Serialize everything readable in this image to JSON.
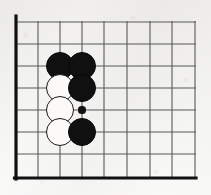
{
  "figure": {
    "name": "go-board-corner-diagram",
    "kind": "go-board",
    "corner": "upper-left",
    "background_color": "#f3f2f0",
    "line_color": "#595959",
    "border_color": "#111111",
    "black_stone_color": "#111010",
    "white_stone_color": "#fbfaf8",
    "white_stone_outline_color": "#1a1918"
  },
  "board": {
    "columns": 9,
    "rows": 8,
    "cell_size": 22,
    "origin_x": 16,
    "origin_y": 22,
    "border_width": 3.2,
    "line_width": 1.1,
    "column_positions": [
      16,
      38,
      60,
      82,
      104,
      127,
      150,
      172,
      195
    ],
    "row_positions": [
      22,
      44,
      66,
      88,
      110,
      132,
      154,
      178
    ],
    "left_edge_x": 16,
    "top_edge_y": 22,
    "right_edge_x": 195,
    "bottom_edge_y": 178
  },
  "stones": [
    {
      "label": "black-stone-c3",
      "color": "black",
      "cx": 60,
      "cy": 66,
      "r": 14
    },
    {
      "label": "black-stone-d3",
      "color": "black",
      "cx": 82,
      "cy": 66,
      "r": 14
    },
    {
      "label": "white-stone-c4",
      "color": "white",
      "cx": 60,
      "cy": 88,
      "r": 14
    },
    {
      "label": "black-stone-d4",
      "color": "black",
      "cx": 82,
      "cy": 88,
      "r": 14
    },
    {
      "label": "white-stone-c5",
      "color": "white",
      "cx": 60,
      "cy": 110,
      "r": 14
    },
    {
      "label": "white-stone-c6",
      "color": "white",
      "cx": 60,
      "cy": 132,
      "r": 14
    },
    {
      "label": "black-stone-d6",
      "color": "black",
      "cx": 82,
      "cy": 132,
      "r": 14
    }
  ],
  "markers": [
    {
      "label": "star-point-d5",
      "kind": "hoshi-dot",
      "cx": 82,
      "cy": 110,
      "r": 3.6
    }
  ]
}
